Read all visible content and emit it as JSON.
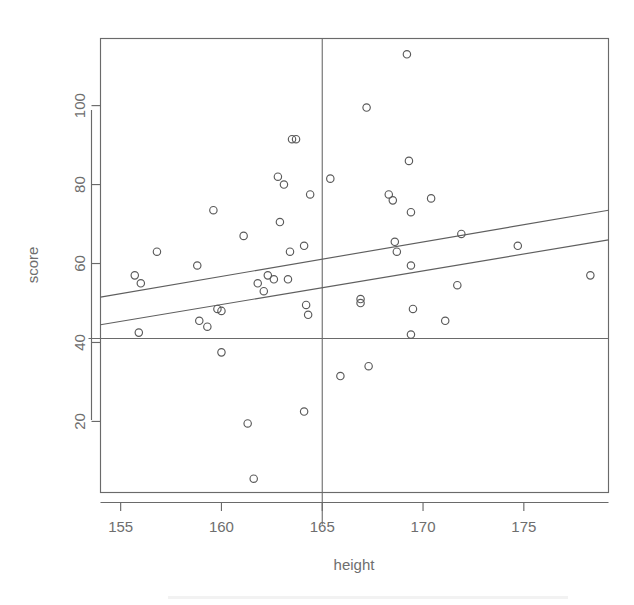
{
  "chart_data": {
    "type": "scatter",
    "title": "",
    "xlabel": "height",
    "ylabel": "score",
    "xlim": [
      154.0,
      179.2
    ],
    "ylim": [
      2.0,
      117.0
    ],
    "xticks": [
      155,
      160,
      165,
      170,
      175
    ],
    "yticks": [
      20,
      40,
      60,
      80,
      100
    ],
    "xtick_labels": [
      "155",
      "160",
      "165",
      "170",
      "175"
    ],
    "ytick_labels": [
      "20",
      "40",
      "60",
      "80",
      "100"
    ],
    "grid": false,
    "legend": "none",
    "marker": "open-circle",
    "points": [
      {
        "x": 155.7,
        "y": 57.0
      },
      {
        "x": 156.0,
        "y": 55.0
      },
      {
        "x": 155.9,
        "y": 42.5
      },
      {
        "x": 156.8,
        "y": 63.0
      },
      {
        "x": 158.8,
        "y": 59.5
      },
      {
        "x": 158.9,
        "y": 45.5
      },
      {
        "x": 159.3,
        "y": 44.0
      },
      {
        "x": 159.6,
        "y": 73.5
      },
      {
        "x": 159.8,
        "y": 48.5
      },
      {
        "x": 160.0,
        "y": 48.0
      },
      {
        "x": 160.0,
        "y": 37.5
      },
      {
        "x": 161.3,
        "y": 19.5
      },
      {
        "x": 161.1,
        "y": 67.0
      },
      {
        "x": 161.6,
        "y": 5.5
      },
      {
        "x": 161.8,
        "y": 55.0
      },
      {
        "x": 162.1,
        "y": 53.0
      },
      {
        "x": 162.3,
        "y": 57.0
      },
      {
        "x": 162.8,
        "y": 82.0
      },
      {
        "x": 162.9,
        "y": 70.5
      },
      {
        "x": 163.1,
        "y": 80.0
      },
      {
        "x": 162.6,
        "y": 56.0
      },
      {
        "x": 163.5,
        "y": 91.5
      },
      {
        "x": 163.7,
        "y": 91.5
      },
      {
        "x": 163.4,
        "y": 63.0
      },
      {
        "x": 163.3,
        "y": 56.0
      },
      {
        "x": 164.1,
        "y": 64.5
      },
      {
        "x": 164.2,
        "y": 49.5
      },
      {
        "x": 164.3,
        "y": 47.0
      },
      {
        "x": 164.4,
        "y": 77.5
      },
      {
        "x": 164.1,
        "y": 22.5
      },
      {
        "x": 165.4,
        "y": 81.5
      },
      {
        "x": 165.9,
        "y": 31.5
      },
      {
        "x": 167.2,
        "y": 99.5
      },
      {
        "x": 166.9,
        "y": 51.0
      },
      {
        "x": 166.9,
        "y": 50.0
      },
      {
        "x": 167.3,
        "y": 34.0
      },
      {
        "x": 168.3,
        "y": 77.5
      },
      {
        "x": 168.5,
        "y": 76.0
      },
      {
        "x": 168.6,
        "y": 65.5
      },
      {
        "x": 168.7,
        "y": 63.0
      },
      {
        "x": 169.2,
        "y": 113.0
      },
      {
        "x": 169.3,
        "y": 86.0
      },
      {
        "x": 169.4,
        "y": 73.0
      },
      {
        "x": 169.4,
        "y": 59.5
      },
      {
        "x": 169.5,
        "y": 48.5
      },
      {
        "x": 169.4,
        "y": 42.0
      },
      {
        "x": 170.4,
        "y": 76.5
      },
      {
        "x": 171.1,
        "y": 45.5
      },
      {
        "x": 171.7,
        "y": 54.5
      },
      {
        "x": 171.9,
        "y": 67.5
      },
      {
        "x": 174.7,
        "y": 64.5
      },
      {
        "x": 178.3,
        "y": 57.0
      }
    ],
    "fit_lines": [
      {
        "name": "upper-fit-line",
        "x_start": 154.0,
        "y_start": 51.5,
        "x_end": 179.2,
        "y_end": 73.5
      },
      {
        "name": "lower-fit-line",
        "x_start": 154.0,
        "y_start": 44.5,
        "x_end": 179.2,
        "y_end": 66.0
      }
    ],
    "reference_lines": [
      {
        "name": "vertical-reference-line",
        "orientation": "vertical",
        "value": 165.0
      },
      {
        "name": "horizontal-reference-line",
        "orientation": "horizontal",
        "value": 41.0
      }
    ],
    "colors": {
      "axis": "#6a6a6a",
      "point_stroke": "#5a5a5a",
      "fit_line": "#5f5f5f",
      "reference_line": "#6a6a6a",
      "background": "#ffffff",
      "text": "#6e6e6e"
    }
  }
}
